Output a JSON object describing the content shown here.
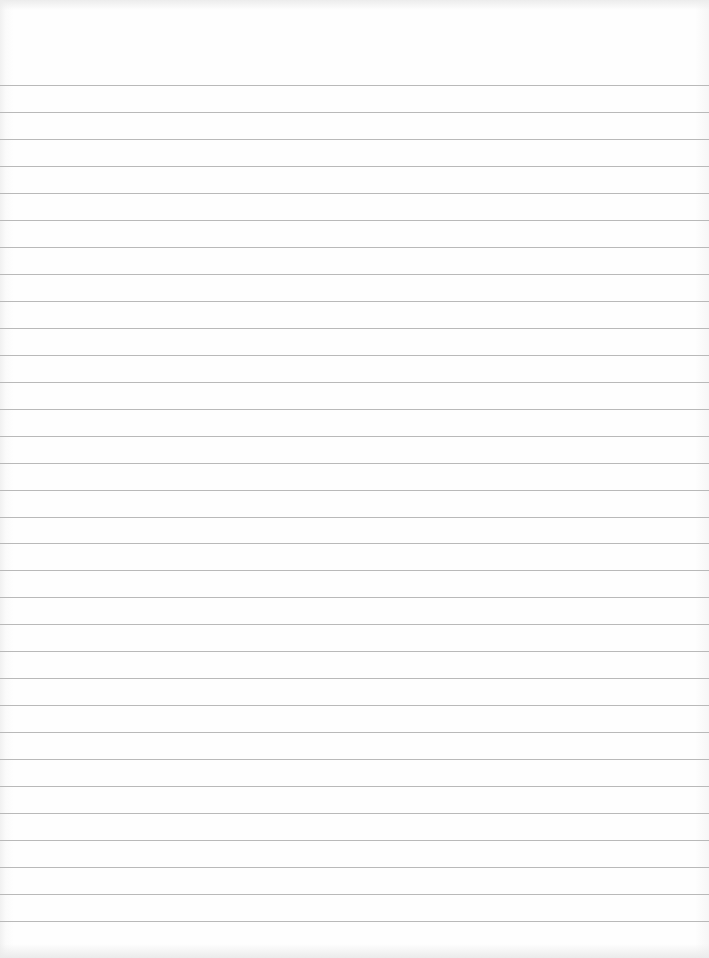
{
  "document": {
    "type": "lined-notebook-paper",
    "content": "",
    "rules": {
      "count": 32,
      "first_y": 85,
      "spacing": 26.97,
      "color": "#b9b9b9"
    },
    "paper_color": "#fdfdfd"
  }
}
